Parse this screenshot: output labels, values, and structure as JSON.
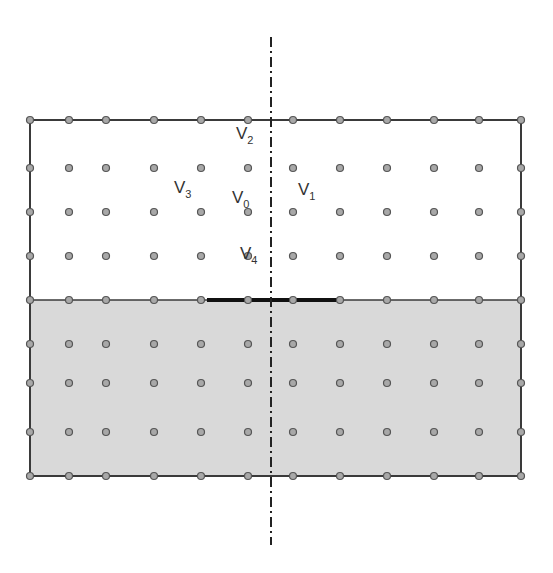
{
  "diagram": {
    "title": "",
    "colors": {
      "background": "#ffffff",
      "lower_region": "#d9d9d9",
      "node_fill": "#a8a8a8",
      "node_stroke": "#555555",
      "border": "#3a3a3a",
      "interface_segment": "#111111",
      "symmetry_axis": "#222222"
    },
    "grid": {
      "columns_x": [
        30,
        69,
        106,
        154,
        201,
        248,
        293,
        340,
        387,
        434,
        479,
        521
      ],
      "rows_y": [
        120,
        168,
        212,
        256,
        300,
        344,
        383,
        432,
        476
      ],
      "interface_row_y": 300
    },
    "domain_box": {
      "x": 30,
      "y": 120,
      "w": 491,
      "h": 356
    },
    "lower_region": {
      "x": 30,
      "y": 300,
      "w": 491,
      "h": 176,
      "label": ""
    },
    "interface_segment": {
      "x1": 207,
      "x2": 340,
      "y": 300
    },
    "symmetry_axis": {
      "x": 271,
      "y1": 37,
      "y2": 545,
      "style": "dash-dot"
    },
    "labels": [
      {
        "id": "V2",
        "base": "V",
        "sub": "2",
        "x": 236,
        "y": 142
      },
      {
        "id": "V3",
        "base": "V",
        "sub": "3",
        "x": 174,
        "y": 196
      },
      {
        "id": "V0",
        "base": "V",
        "sub": "0",
        "x": 232,
        "y": 206
      },
      {
        "id": "V1",
        "base": "V",
        "sub": "1",
        "x": 298,
        "y": 198
      },
      {
        "id": "V4",
        "base": "V",
        "sub": "4",
        "x": 240,
        "y": 262
      }
    ]
  }
}
